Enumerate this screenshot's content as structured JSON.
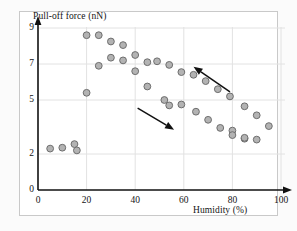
{
  "figure": {
    "background_color": "#fbfbfb",
    "plot_background_color": "#ffffff",
    "border_color": "#c9c9c9"
  },
  "chart_data": {
    "type": "scatter",
    "title": "",
    "xlabel": "Humidity (%)",
    "ylabel": "Pull-off force (nN)",
    "xlim": [
      0,
      100
    ],
    "ylim": [
      0,
      9
    ],
    "xticks": [
      0,
      20,
      40,
      60,
      80,
      100
    ],
    "yticks": [
      0,
      2,
      5,
      7,
      9
    ],
    "grid": true,
    "grid_color": "#e2e2e2",
    "marker": {
      "shape": "circle",
      "fill_color": "#b3b3b3",
      "edge_color": "#6e6e6e",
      "radius_px": 3.4
    },
    "legend": "none",
    "series": [
      {
        "name": "increasing humidity",
        "direction": "increasing",
        "points": [
          {
            "x": 5.0,
            "y": 2.3
          },
          {
            "x": 10.0,
            "y": 2.35
          },
          {
            "x": 15.0,
            "y": 2.55
          },
          {
            "x": 16.0,
            "y": 2.2
          },
          {
            "x": 20.0,
            "y": 5.4
          },
          {
            "x": 20.0,
            "y": 8.6
          },
          {
            "x": 25.0,
            "y": 8.6
          },
          {
            "x": 25.0,
            "y": 6.9
          },
          {
            "x": 30.0,
            "y": 8.25
          },
          {
            "x": 30.0,
            "y": 7.35
          },
          {
            "x": 35.0,
            "y": 8.05
          },
          {
            "x": 35.0,
            "y": 7.2
          },
          {
            "x": 40.0,
            "y": 7.5
          },
          {
            "x": 40.0,
            "y": 6.6
          },
          {
            "x": 45.0,
            "y": 5.75
          },
          {
            "x": 45.0,
            "y": 7.1
          },
          {
            "x": 49.0,
            "y": 7.15
          },
          {
            "x": 54.0,
            "y": 6.95
          },
          {
            "x": 52.0,
            "y": 5.0
          },
          {
            "x": 54.0,
            "y": 4.7
          },
          {
            "x": 59.0,
            "y": 4.75
          },
          {
            "x": 65.0,
            "y": 4.35
          },
          {
            "x": 70.0,
            "y": 3.9
          },
          {
            "x": 75.0,
            "y": 3.45
          },
          {
            "x": 80.0,
            "y": 3.3
          },
          {
            "x": 85.0,
            "y": 2.85
          },
          {
            "x": 90.0,
            "y": 2.8
          },
          {
            "x": 95.0,
            "y": 3.55
          }
        ]
      },
      {
        "name": "decreasing humidity",
        "direction": "decreasing",
        "points": [
          {
            "x": 59.0,
            "y": 6.55
          },
          {
            "x": 64.0,
            "y": 6.4
          },
          {
            "x": 69.0,
            "y": 6.05
          },
          {
            "x": 74.0,
            "y": 5.6
          },
          {
            "x": 79.0,
            "y": 5.2
          },
          {
            "x": 85.0,
            "y": 4.65
          },
          {
            "x": 90.0,
            "y": 4.15
          },
          {
            "x": 80.0,
            "y": 3.05
          },
          {
            "x": 85.0,
            "y": 2.9
          }
        ]
      }
    ],
    "annotations": [
      {
        "name": "arrow-decreasing-force",
        "type": "arrow",
        "from": {
          "x": 41,
          "y": 4.55
        },
        "to": {
          "x": 56,
          "y": 3.35
        },
        "color": "#111111"
      },
      {
        "name": "arrow-increasing-force",
        "type": "arrow",
        "from": {
          "x": 79,
          "y": 5.45
        },
        "to": {
          "x": 64,
          "y": 6.85
        },
        "color": "#111111"
      }
    ]
  }
}
